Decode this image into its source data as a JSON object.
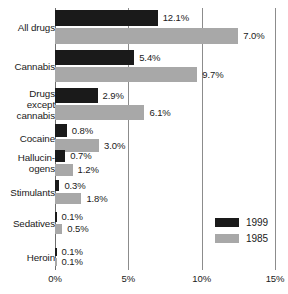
{
  "chart_data": {
    "type": "bar",
    "orientation": "horizontal",
    "title": "",
    "xlabel": "",
    "ylabel": "",
    "xlim": [
      0,
      15
    ],
    "xtick_labels": [
      "0%",
      "5%",
      "10%",
      "15%"
    ],
    "xticks": [
      0,
      5,
      10,
      15
    ],
    "grid": true,
    "legend_position": "bottom-right",
    "categories": [
      "All drugs",
      "Cannabis",
      "Drugs\nexcept\ncannabis",
      "Cocaine",
      "Hallucin-\nogens",
      "Stimulants",
      "Sedatives",
      "Heroin"
    ],
    "series": [
      {
        "name": "1999",
        "color": "#1a1a1a",
        "labels": [
          "12.1%",
          "5.4%",
          "2.9%",
          "0.8%",
          "0.7%",
          "0.3%",
          "0.1%",
          "0.1%"
        ],
        "values": [
          12.1,
          5.4,
          2.9,
          0.8,
          0.7,
          0.3,
          0.1,
          0.1
        ],
        "drawn_lengths": [
          7.0,
          5.4,
          2.9,
          0.8,
          0.7,
          0.3,
          0.1,
          0.1
        ]
      },
      {
        "name": "1985",
        "color": "#a8a8a8",
        "labels": [
          "7.0%",
          "9.7%",
          "6.1%",
          "3.0%",
          "1.2%",
          "1.8%",
          "0.5%",
          "0.1%"
        ],
        "values": [
          7.0,
          9.7,
          6.1,
          3.0,
          1.2,
          1.8,
          0.5,
          0.1
        ],
        "drawn_lengths": [
          12.5,
          9.7,
          6.1,
          3.0,
          1.2,
          1.8,
          0.5,
          0.1
        ]
      }
    ]
  },
  "legend": {
    "items": [
      {
        "label": "1999",
        "color": "#1a1a1a"
      },
      {
        "label": "1985",
        "color": "#a8a8a8"
      }
    ]
  },
  "colors": {
    "series_1999": "#1a1a1a",
    "series_1985": "#a8a8a8",
    "gridline": "#8c8c8c",
    "text": "#1a1a1a",
    "background": "#ffffff"
  }
}
